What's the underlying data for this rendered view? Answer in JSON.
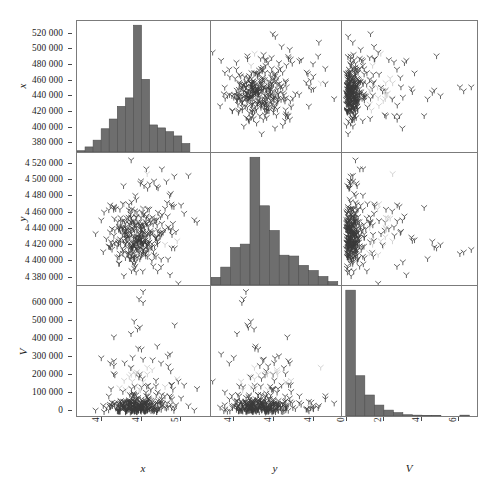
{
  "figure": {
    "type": "scatter-plot-matrix",
    "variables": [
      "x",
      "y",
      "V"
    ],
    "marker_glyph": "tri-down",
    "hist_color": "#6e6e6e",
    "frame_color": "#7b7b7b",
    "point_color": "#3a3a3a",
    "highlight_color": "#c9c9c9"
  },
  "axes": {
    "x": {
      "label": "x",
      "range": [
        370000,
        535000
      ],
      "ticks": [
        400000,
        450000,
        500000
      ],
      "tick_labels": [
        "400 000",
        "450 000",
        "500 000"
      ]
    },
    "y": {
      "label": "y",
      "range": [
        4372000,
        4532000
      ],
      "ticks": [
        4400000,
        4450000,
        4500000
      ],
      "tick_labels": [
        "4 400 000",
        "4 450 000",
        "4 500 000"
      ]
    },
    "V": {
      "label": "V",
      "range": [
        -20000,
        690000
      ],
      "ticks": [
        0,
        200000,
        400000,
        600000
      ],
      "tick_labels": [
        "0",
        "200 000",
        "400 000",
        "600 000"
      ]
    }
  },
  "left_axis_ticks": {
    "row1": {
      "variable": "x",
      "labels": [
        "520 000",
        "500 000",
        "480 000",
        "460 000",
        "440 000",
        "420 000",
        "400 000",
        "380 000"
      ],
      "values": [
        520000,
        500000,
        480000,
        460000,
        440000,
        420000,
        400000,
        380000
      ],
      "range": [
        370000,
        535000
      ]
    },
    "row2": {
      "variable": "y",
      "labels": [
        "4 520 000",
        "4 500 000",
        "4 480 000",
        "4 460 000",
        "4 440 000",
        "4 420 000",
        "4 400 000",
        "4 380 000"
      ],
      "values": [
        4520000,
        4500000,
        4480000,
        4460000,
        4440000,
        4420000,
        4400000,
        4380000
      ],
      "range": [
        4372000,
        4532000
      ]
    },
    "row3": {
      "variable": "V",
      "labels": [
        "600 000",
        "500 000",
        "400 000",
        "300 000",
        "200 000",
        "100 000",
        "0"
      ],
      "values": [
        600000,
        500000,
        400000,
        300000,
        200000,
        100000,
        0
      ],
      "range": [
        -20000,
        690000
      ]
    }
  },
  "bottom_axis_ticks": {
    "col1": {
      "variable": "x",
      "labels": [
        "400 000",
        "450 000",
        "500 000"
      ],
      "values": [
        400000,
        450000,
        500000
      ]
    },
    "col2": {
      "variable": "y",
      "labels": [
        "4 400 000",
        "4 450 000",
        "4 500 000"
      ],
      "values": [
        4400000,
        4450000,
        4500000
      ]
    },
    "col3": {
      "variable": "V",
      "labels": [
        "0",
        "200 000",
        "400 000",
        "600 000"
      ],
      "values": [
        0,
        200000,
        400000,
        600000
      ]
    }
  },
  "chart_data": {
    "type": "scatter",
    "title": "",
    "xlabel": "x",
    "ylabel": "V",
    "legend": [],
    "grid": false,
    "panels": [
      {
        "row": 1,
        "col": 1,
        "kind": "histogram",
        "variable": "x",
        "xlim": [
          370000,
          535000
        ],
        "bin_edges": [
          370000,
          380000,
          390000,
          400000,
          410000,
          420000,
          430000,
          440000,
          450000,
          460000,
          470000,
          480000,
          490000,
          500000,
          510000
        ],
        "counts": [
          3,
          12,
          28,
          55,
          78,
          108,
          128,
          300,
          172,
          64,
          57,
          48,
          38,
          20
        ],
        "ylim": [
          0,
          310
        ]
      },
      {
        "row": 1,
        "col": 2,
        "kind": "scatter",
        "xvar": "y",
        "yvar": "x",
        "xlim": [
          4372000,
          4532000
        ],
        "ylim": [
          370000,
          535000
        ],
        "n_points": 330
      },
      {
        "row": 1,
        "col": 3,
        "kind": "scatter",
        "xvar": "V",
        "yvar": "x",
        "xlim": [
          -20000,
          690000
        ],
        "ylim": [
          370000,
          535000
        ],
        "n_points": 330
      },
      {
        "row": 2,
        "col": 1,
        "kind": "scatter",
        "xvar": "x",
        "yvar": "y",
        "xlim": [
          370000,
          535000
        ],
        "ylim": [
          4372000,
          4532000
        ],
        "n_points": 330
      },
      {
        "row": 2,
        "col": 2,
        "kind": "histogram",
        "variable": "y",
        "xlim": [
          4372000,
          4532000
        ],
        "bin_edges": [
          4372000,
          4384000,
          4396000,
          4408000,
          4420000,
          4432000,
          4444000,
          4456000,
          4468000,
          4480000,
          4492000,
          4504000,
          4516000,
          4528000
        ],
        "counts": [
          18,
          42,
          88,
          96,
          300,
          186,
          128,
          70,
          68,
          46,
          34,
          20,
          8
        ],
        "ylim": [
          0,
          310
        ]
      },
      {
        "row": 2,
        "col": 3,
        "kind": "scatter",
        "xvar": "V",
        "yvar": "y",
        "xlim": [
          -20000,
          690000
        ],
        "ylim": [
          4372000,
          4532000
        ],
        "n_points": 330
      },
      {
        "row": 3,
        "col": 1,
        "kind": "scatter",
        "xvar": "x",
        "yvar": "V",
        "xlim": [
          370000,
          535000
        ],
        "ylim": [
          -20000,
          690000
        ],
        "n_points": 330
      },
      {
        "row": 3,
        "col": 2,
        "kind": "scatter",
        "xvar": "y",
        "yvar": "V",
        "xlim": [
          4372000,
          4532000
        ],
        "ylim": [
          -20000,
          690000
        ],
        "n_points": 330
      },
      {
        "row": 3,
        "col": 3,
        "kind": "histogram",
        "variable": "V",
        "xlim": [
          -20000,
          690000
        ],
        "bin_edges": [
          0,
          50000,
          100000,
          150000,
          200000,
          250000,
          300000,
          350000,
          400000,
          450000,
          500000,
          550000,
          600000,
          650000
        ],
        "counts": [
          300,
          96,
          50,
          26,
          14,
          8,
          3,
          2,
          1,
          1,
          0,
          0,
          2,
          0
        ],
        "ylim": [
          0,
          310
        ]
      }
    ]
  }
}
